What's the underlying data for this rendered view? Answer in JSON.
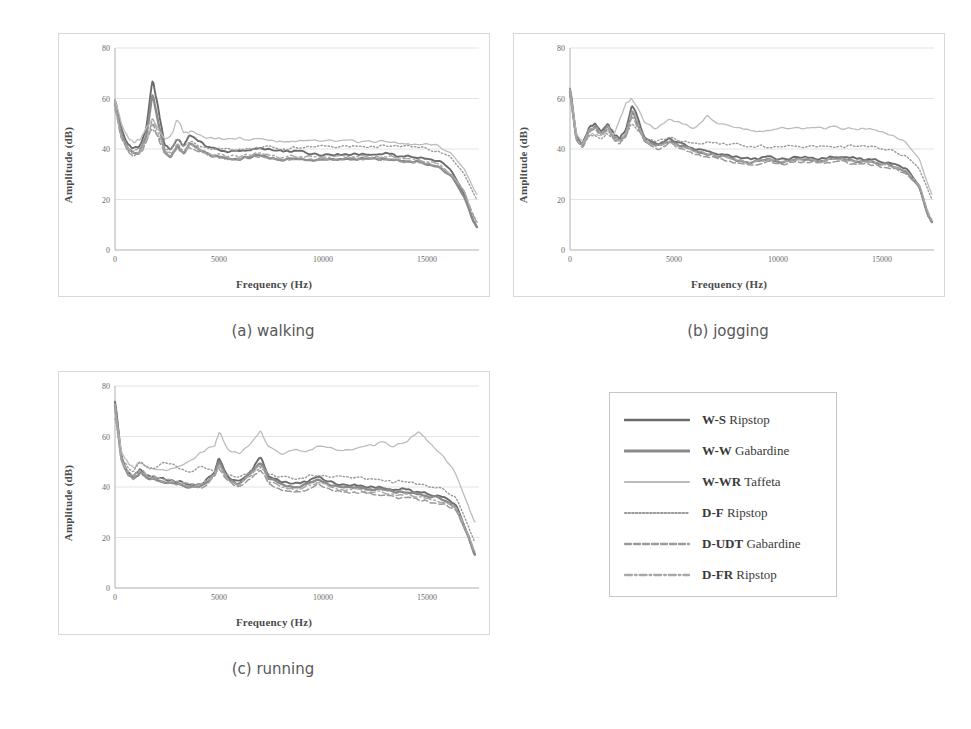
{
  "figure": {
    "panels": [
      {
        "id": "a",
        "caption": "(a) walking",
        "xlabel": "Frequency (Hz)",
        "ylabel": "Amplitude (dB)"
      },
      {
        "id": "b",
        "caption": "(b) jogging",
        "xlabel": "Frequency (Hz)",
        "ylabel": "Amplitude (dB)"
      },
      {
        "id": "c",
        "caption": "(c) running",
        "xlabel": "Frequency (Hz)",
        "ylabel": "Amplitude (dB)"
      }
    ]
  },
  "legend": {
    "entries": [
      {
        "code": "W-S",
        "fabric": "Ripstop",
        "style": "solid-dark",
        "color": "#6b6b6b"
      },
      {
        "code": "W-W",
        "fabric": "Gabardine",
        "style": "solid-thick",
        "color": "#8a8a8a"
      },
      {
        "code": "W-WR",
        "fabric": "Taffeta",
        "style": "solid-light",
        "color": "#bcbcbc"
      },
      {
        "code": "D-F",
        "fabric": "Ripstop",
        "style": "dotted",
        "color": "#9a9a9a"
      },
      {
        "code": "D-UDT",
        "fabric": "Gabardine",
        "style": "dashed",
        "color": "#9a9a9a"
      },
      {
        "code": "D-FR",
        "fabric": "Ripstop",
        "style": "dashdot",
        "color": "#a8a8a8"
      }
    ]
  },
  "chart_data": [
    {
      "type": "line",
      "title": "(a) walking",
      "xlabel": "Frequency (Hz)",
      "ylabel": "Amplitude (dB)",
      "xlim": [
        0,
        17500
      ],
      "ylim": [
        0,
        80
      ],
      "xticks": [
        0,
        5000,
        10000,
        15000
      ],
      "yticks": [
        0,
        20,
        40,
        60,
        80
      ],
      "grid": true,
      "legend_position": "external-right",
      "x": [
        0,
        300,
        600,
        900,
        1200,
        1500,
        1800,
        2100,
        2400,
        2700,
        3000,
        3300,
        3600,
        4200,
        4800,
        5400,
        6000,
        6600,
        7200,
        7800,
        8400,
        9000,
        9600,
        10200,
        10800,
        11400,
        12000,
        12600,
        13200,
        13800,
        14400,
        15000,
        15600,
        16200,
        16800,
        17200,
        17400
      ],
      "series": [
        {
          "name": "W-S Ripstop",
          "values": [
            60,
            48,
            42,
            40,
            41,
            48,
            68,
            55,
            41,
            40,
            44,
            41,
            46,
            42,
            40,
            39,
            39,
            40,
            40,
            39,
            39,
            39,
            38,
            38,
            38,
            38,
            38,
            38,
            38,
            37,
            37,
            36,
            35,
            31,
            22,
            12,
            9
          ]
        },
        {
          "name": "W-W Gabardine",
          "values": [
            59,
            46,
            40,
            38,
            39,
            45,
            62,
            50,
            38,
            37,
            41,
            38,
            42,
            39,
            37,
            36,
            36,
            37,
            37,
            36,
            36,
            36,
            36,
            36,
            36,
            36,
            36,
            36,
            36,
            35,
            35,
            34,
            33,
            29,
            21,
            12,
            9
          ]
        },
        {
          "name": "W-WR Taffeta",
          "values": [
            60,
            50,
            45,
            43,
            44,
            48,
            52,
            48,
            44,
            45,
            52,
            46,
            47,
            45,
            44,
            44,
            44,
            44,
            44,
            43,
            43,
            43,
            43,
            43,
            43,
            43,
            43,
            43,
            43,
            42,
            42,
            42,
            41,
            38,
            32,
            25,
            22
          ]
        },
        {
          "name": "D-F Ripstop",
          "values": [
            58,
            46,
            41,
            39,
            40,
            44,
            48,
            45,
            40,
            40,
            44,
            41,
            43,
            41,
            40,
            40,
            40,
            40,
            41,
            40,
            40,
            41,
            41,
            41,
            41,
            41,
            41,
            41,
            41,
            41,
            41,
            40,
            39,
            36,
            30,
            23,
            20
          ]
        },
        {
          "name": "D-UDT Gabardine",
          "values": [
            57,
            44,
            39,
            37,
            38,
            42,
            50,
            44,
            38,
            37,
            41,
            38,
            41,
            38,
            37,
            36,
            36,
            37,
            37,
            36,
            36,
            36,
            36,
            36,
            36,
            36,
            36,
            36,
            36,
            35,
            35,
            34,
            33,
            30,
            23,
            14,
            11
          ]
        },
        {
          "name": "D-FR Ripstop",
          "values": [
            58,
            45,
            40,
            38,
            39,
            43,
            52,
            46,
            39,
            38,
            42,
            39,
            42,
            39,
            38,
            37,
            37,
            38,
            38,
            37,
            37,
            37,
            37,
            37,
            37,
            37,
            37,
            37,
            37,
            36,
            36,
            35,
            34,
            30,
            23,
            14,
            11
          ]
        }
      ]
    },
    {
      "type": "line",
      "title": "(b) jogging",
      "xlabel": "Frequency (Hz)",
      "ylabel": "Amplitude (dB)",
      "xlim": [
        0,
        17500
      ],
      "ylim": [
        0,
        80
      ],
      "xticks": [
        0,
        5000,
        10000,
        15000
      ],
      "yticks": [
        0,
        20,
        40,
        60,
        80
      ],
      "grid": true,
      "legend_position": "external-right",
      "x": [
        0,
        300,
        600,
        900,
        1200,
        1500,
        1800,
        2100,
        2400,
        2700,
        3000,
        3600,
        4200,
        4800,
        5400,
        6000,
        6600,
        7200,
        7800,
        8400,
        9000,
        9600,
        10200,
        10800,
        11400,
        12000,
        12600,
        13200,
        13800,
        14400,
        15000,
        15600,
        16200,
        16800,
        17200,
        17400
      ],
      "series": [
        {
          "name": "W-S Ripstop",
          "values": [
            65,
            45,
            42,
            48,
            50,
            47,
            50,
            46,
            44,
            48,
            58,
            44,
            42,
            44,
            42,
            40,
            39,
            38,
            37,
            36,
            36,
            37,
            36,
            37,
            37,
            36,
            37,
            37,
            36,
            36,
            35,
            34,
            32,
            25,
            14,
            11
          ]
        },
        {
          "name": "W-W Gabardine",
          "values": [
            64,
            44,
            41,
            47,
            49,
            46,
            49,
            45,
            43,
            46,
            55,
            43,
            41,
            43,
            41,
            39,
            38,
            37,
            36,
            35,
            35,
            36,
            35,
            36,
            36,
            35,
            36,
            36,
            35,
            35,
            34,
            33,
            31,
            25,
            14,
            11
          ]
        },
        {
          "name": "W-WR Taffeta",
          "values": [
            63,
            46,
            43,
            46,
            46,
            45,
            47,
            46,
            52,
            58,
            60,
            50,
            48,
            52,
            50,
            48,
            53,
            50,
            49,
            48,
            47,
            47,
            48,
            48,
            48,
            48,
            49,
            48,
            48,
            48,
            47,
            45,
            42,
            36,
            26,
            22
          ]
        },
        {
          "name": "D-F Ripstop",
          "values": [
            62,
            44,
            42,
            45,
            45,
            44,
            46,
            44,
            43,
            46,
            50,
            44,
            43,
            45,
            43,
            42,
            43,
            42,
            42,
            41,
            41,
            41,
            41,
            41,
            41,
            41,
            41,
            41,
            41,
            41,
            40,
            39,
            37,
            32,
            24,
            20
          ]
        },
        {
          "name": "D-UDT Gabardine",
          "values": [
            63,
            43,
            40,
            46,
            48,
            45,
            48,
            44,
            42,
            45,
            54,
            42,
            40,
            42,
            40,
            38,
            37,
            36,
            35,
            34,
            34,
            35,
            34,
            35,
            35,
            34,
            35,
            35,
            34,
            34,
            33,
            32,
            30,
            25,
            14,
            11
          ]
        },
        {
          "name": "D-FR Ripstop",
          "values": [
            64,
            44,
            41,
            47,
            49,
            46,
            49,
            45,
            43,
            46,
            56,
            43,
            41,
            43,
            41,
            39,
            38,
            37,
            36,
            35,
            35,
            36,
            35,
            36,
            36,
            35,
            36,
            36,
            35,
            35,
            34,
            33,
            31,
            26,
            15,
            12
          ]
        }
      ]
    },
    {
      "type": "line",
      "title": "(c) running",
      "xlabel": "Frequency (Hz)",
      "ylabel": "Amplitude (dB)",
      "xlim": [
        0,
        17500
      ],
      "ylim": [
        0,
        80
      ],
      "xticks": [
        0,
        5000,
        10000,
        15000
      ],
      "yticks": [
        0,
        20,
        40,
        60,
        80
      ],
      "grid": true,
      "legend_position": "external-right",
      "x": [
        0,
        300,
        600,
        900,
        1200,
        1500,
        1800,
        2400,
        3000,
        3600,
        4200,
        4800,
        5000,
        5400,
        6000,
        6600,
        7000,
        7400,
        8000,
        8600,
        9200,
        9800,
        10400,
        11000,
        11600,
        12200,
        12800,
        13400,
        14000,
        14600,
        15200,
        15800,
        16400,
        17000,
        17300
      ],
      "series": [
        {
          "name": "W-S Ripstop",
          "values": [
            75,
            52,
            46,
            44,
            47,
            45,
            44,
            43,
            42,
            41,
            41,
            46,
            52,
            44,
            42,
            47,
            52,
            44,
            42,
            41,
            42,
            44,
            42,
            41,
            41,
            40,
            40,
            39,
            39,
            38,
            37,
            36,
            33,
            20,
            13
          ]
        },
        {
          "name": "W-W Gabardine",
          "values": [
            74,
            51,
            45,
            43,
            46,
            44,
            43,
            42,
            41,
            40,
            40,
            45,
            50,
            43,
            41,
            46,
            50,
            43,
            41,
            40,
            41,
            43,
            41,
            40,
            40,
            39,
            39,
            38,
            38,
            37,
            36,
            35,
            32,
            20,
            13
          ]
        },
        {
          "name": "W-WR Taffeta",
          "values": [
            70,
            54,
            50,
            48,
            50,
            48,
            47,
            47,
            48,
            50,
            54,
            56,
            62,
            55,
            53,
            58,
            62,
            56,
            53,
            55,
            54,
            56,
            55,
            54,
            55,
            56,
            58,
            56,
            58,
            62,
            57,
            52,
            45,
            32,
            26
          ]
        },
        {
          "name": "D-F Ripstop",
          "values": [
            68,
            52,
            48,
            46,
            50,
            48,
            47,
            50,
            48,
            46,
            48,
            46,
            48,
            45,
            44,
            46,
            48,
            45,
            44,
            43,
            44,
            45,
            44,
            44,
            44,
            43,
            43,
            42,
            42,
            41,
            40,
            39,
            36,
            24,
            18
          ]
        },
        {
          "name": "D-UDT Gabardine",
          "values": [
            72,
            50,
            45,
            43,
            46,
            44,
            43,
            42,
            41,
            40,
            40,
            44,
            48,
            42,
            40,
            44,
            47,
            41,
            39,
            38,
            39,
            41,
            39,
            38,
            38,
            37,
            37,
            36,
            36,
            35,
            34,
            33,
            31,
            20,
            14
          ]
        },
        {
          "name": "D-FR Ripstop",
          "values": [
            73,
            51,
            46,
            44,
            47,
            45,
            44,
            43,
            42,
            41,
            41,
            45,
            49,
            43,
            41,
            45,
            49,
            42,
            40,
            39,
            40,
            42,
            40,
            39,
            39,
            38,
            38,
            37,
            37,
            36,
            35,
            34,
            32,
            21,
            14
          ]
        }
      ]
    }
  ]
}
